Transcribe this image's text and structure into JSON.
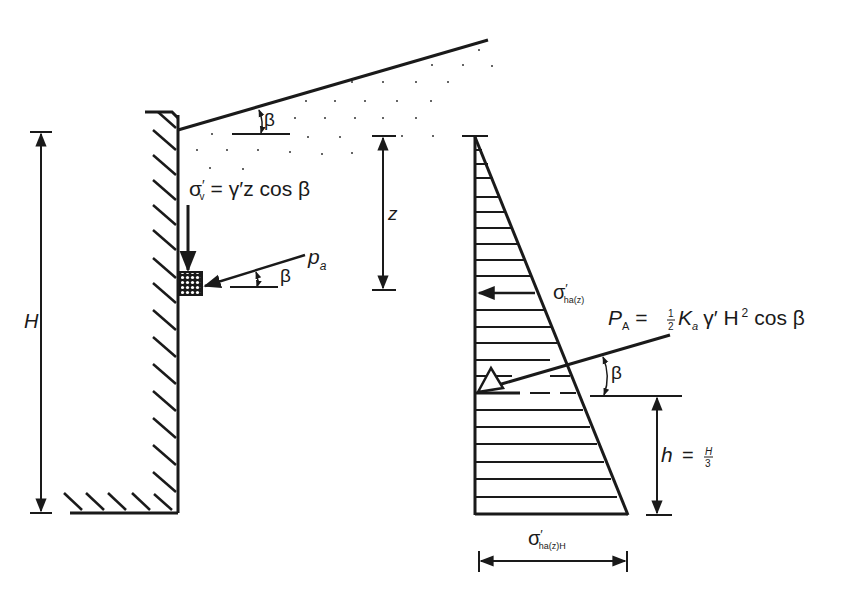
{
  "diagram": {
    "colors": {
      "ink": "#1a1a1a",
      "background": "#ffffff"
    },
    "labels": {
      "beta_top": "β",
      "sigma_v_sym": "σ",
      "sigma_v_prime": "′",
      "sigma_v_sub": "v",
      "sigma_v_rhs": "= γ′z cos β",
      "pa_sym": "p",
      "pa_sub": "a",
      "beta_pa": "β",
      "z_label": "z",
      "H_label": "H",
      "sigma_ha_sym": "σ",
      "sigma_ha_prime": "′",
      "sigma_ha_sub": "ha(z)",
      "PA_sym": "P",
      "PA_sub": "A",
      "PA_eq": "=",
      "PA_half_num": "1",
      "PA_half_den": "2",
      "PA_Ka": "K",
      "PA_Ka_sub": "a",
      "PA_rest": "γ′ H",
      "PA_sq": "2",
      "PA_cos": "cos β",
      "beta_PA": "β",
      "h_label": "h",
      "h_eq": "=",
      "h_num": "H",
      "h_den": "3",
      "sigma_base_sym": "σ",
      "sigma_base_prime": "′",
      "sigma_base_sub": "ha(z)H"
    }
  }
}
